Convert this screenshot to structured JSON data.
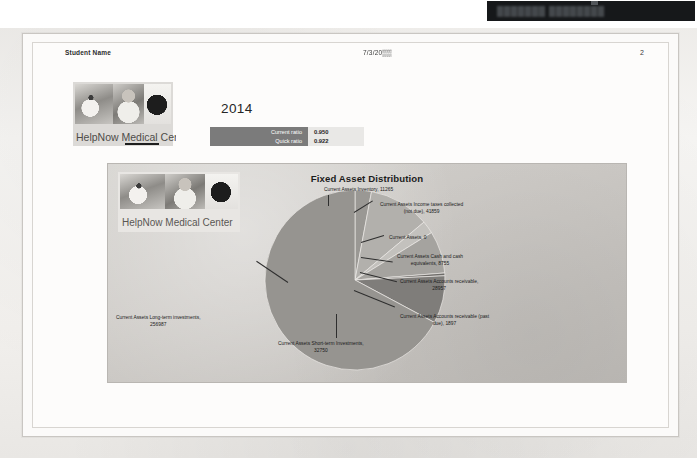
{
  "window": {
    "top_bar_text": "███████ ████████"
  },
  "header": {
    "student_name": "Student Name",
    "date": "7/3/20▒▒",
    "page_number": "2"
  },
  "branding": {
    "logo_caption": "HelpNow Medical Center",
    "icon_photo_left": "doctor-photo",
    "icon_photo_center": "patient-photo",
    "icon_photo_right": "silhouette-photo"
  },
  "year_block": {
    "year": "2014"
  },
  "ratios": {
    "rows": [
      {
        "label": "Current ratio",
        "value": "0.950"
      },
      {
        "label": "Quick ratio",
        "value": "0.922"
      }
    ]
  },
  "chart_data": {
    "type": "pie",
    "title": "Fixed Asset Distribution",
    "xlabel": "",
    "ylabel": "",
    "legend_position": "none",
    "labels_show_value": true,
    "categories": [
      "Current Assets Inventory",
      "Current Assets Income taxes collected (not due)",
      "Current Assets",
      "Current Assets Cash and cash equivalents",
      "Current Assets Accounts receivable",
      "Current Assets Accounts receivable (past due)",
      "Current Assets Short-term Investments",
      "Current Assets Long-term investments"
    ],
    "values": [
      11265,
      41859,
      0,
      8755,
      28957,
      1897,
      32750,
      256987
    ],
    "total": 382470,
    "slice_colors": [
      "#9a9894",
      "#b2b0ac",
      "#8d8b87",
      "#c3c1bd",
      "#a5a39f",
      "#6e6c69",
      "#7f7d7a",
      "#969490"
    ],
    "labels": [
      {
        "text_line1": "Current Assets Inventory, 11265",
        "text_line2": ""
      },
      {
        "text_line1": "Current Assets Income taxes collected",
        "text_line2": "(not due), 41859"
      },
      {
        "text_line1": "Current Assets, 0",
        "text_line2": ""
      },
      {
        "text_line1": "Current Assets Cash and cash",
        "text_line2": "equivalents, 8755"
      },
      {
        "text_line1": "Current Assets Accounts receivable,",
        "text_line2": "28957"
      },
      {
        "text_line1": "Current Assets Accounts receivable (past",
        "text_line2": "due), 1897"
      },
      {
        "text_line1": "Current Assets Short-term Investments,",
        "text_line2": "32750"
      },
      {
        "text_line1": "Current Assets Long-term investments,",
        "text_line2": "256987"
      }
    ]
  },
  "colors": {
    "accent": "#7b7b7b",
    "panel_bg": "#cecbc7",
    "page_bg": "#fdfcfb"
  }
}
